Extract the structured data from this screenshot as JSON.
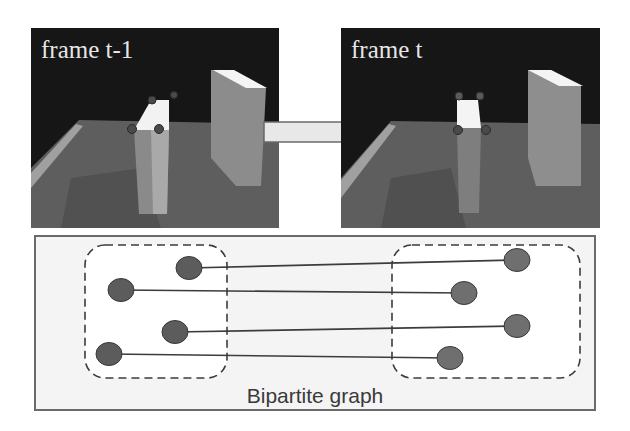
{
  "figure": {
    "frames": [
      {
        "id": "prev",
        "label": "frame t-1"
      },
      {
        "id": "curr",
        "label": "frame t"
      }
    ],
    "arrow": {
      "direction": "right",
      "from": "frame t-1",
      "to": "frame t"
    },
    "graph": {
      "label": "Bipartite graph",
      "left_set": {
        "name": "frame t-1 features",
        "nodes": [
          {
            "id": "L1",
            "x": 189,
            "y": 268
          },
          {
            "id": "L2",
            "x": 121,
            "y": 290
          },
          {
            "id": "L3",
            "x": 175,
            "y": 332
          },
          {
            "id": "L4",
            "x": 109,
            "y": 354
          }
        ]
      },
      "right_set": {
        "name": "frame t features",
        "nodes": [
          {
            "id": "R1",
            "x": 517,
            "y": 260
          },
          {
            "id": "R2",
            "x": 464,
            "y": 293
          },
          {
            "id": "R3",
            "x": 517,
            "y": 326
          },
          {
            "id": "R4",
            "x": 450,
            "y": 358
          }
        ]
      },
      "edges": [
        {
          "from": "L1",
          "to": "R1"
        },
        {
          "from": "L2",
          "to": "R2"
        },
        {
          "from": "L3",
          "to": "R3"
        },
        {
          "from": "L4",
          "to": "R4"
        }
      ]
    },
    "colors": {
      "node_fill": "#5c5c5c",
      "node_fill_right": "#6f6f6f",
      "edge": "#3c3c3c",
      "dashed_border": "#3c3c3c",
      "panel_border": "#6a6a6a",
      "label_text": "#3a3a3a"
    }
  }
}
